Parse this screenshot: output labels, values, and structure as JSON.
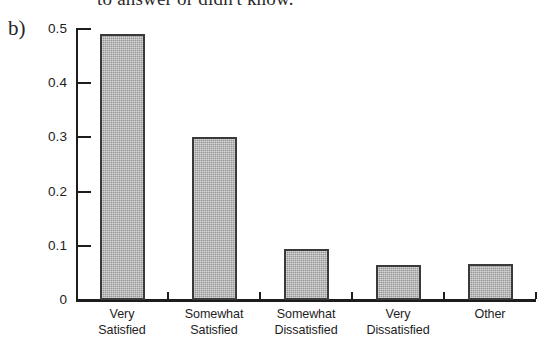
{
  "page": {
    "clipped_text_above": "to answer or didn't know.",
    "panel_label": "b)"
  },
  "chart_data": {
    "type": "bar",
    "title": "",
    "xlabel": "",
    "ylabel": "",
    "ylim": [
      0,
      0.5
    ],
    "yticks": [
      "0",
      "0.1",
      "0.2",
      "0.3",
      "0.4",
      "0.5"
    ],
    "ytick_values": [
      0,
      0.1,
      0.2,
      0.3,
      0.4,
      0.5
    ],
    "grid": false,
    "legend": false,
    "categories": [
      "Very Satisfied",
      "Somewhat Satisfied",
      "Somewhat Dissatisfied",
      "Very Dissatisfied",
      "Other"
    ],
    "category_lines": [
      [
        "Very",
        "Satisfied"
      ],
      [
        "Somewhat",
        "Satisfied"
      ],
      [
        "Somewhat",
        "Dissatisfied"
      ],
      [
        "Very",
        "Dissatisfied"
      ],
      [
        "Other",
        ""
      ]
    ],
    "values": [
      0.49,
      0.3,
      0.095,
      0.065,
      0.066
    ],
    "bar_fill_color": "#a9a9a9",
    "bar_edge_color": "#3a3a3a",
    "axis_color": "#1d1d1d"
  }
}
